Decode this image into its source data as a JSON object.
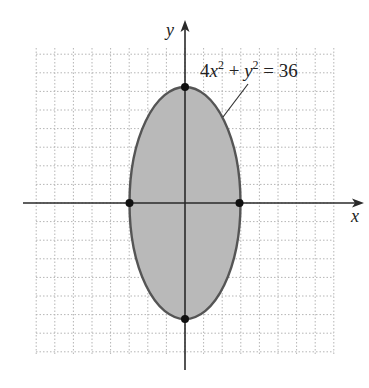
{
  "chart_data": {
    "type": "line",
    "title": "",
    "xlabel": "x",
    "ylabel": "y",
    "xlim": [
      -8.5,
      8.5
    ],
    "ylim": [
      -8.5,
      8.5
    ],
    "grid": true,
    "series": [
      {
        "name": "4x^2 + y^2 = 36",
        "kind": "ellipse",
        "center": [
          0,
          0
        ],
        "semi_axis_x": 3,
        "semi_axis_y": 6,
        "filled": true
      }
    ],
    "points": [
      {
        "x": 0,
        "y": 6
      },
      {
        "x": 0,
        "y": -6
      },
      {
        "x": -3,
        "y": 0
      },
      {
        "x": 3,
        "y": 0
      }
    ],
    "annotations": [
      {
        "text": "4x² + y² = 36",
        "points_to": "ellipse"
      }
    ]
  },
  "labels": {
    "x_axis": "x",
    "y_axis": "y",
    "eq_coef": "4",
    "eq_x": "x",
    "eq_sup1": "2",
    "eq_plus": " + ",
    "eq_y": "y",
    "eq_sup2": "2",
    "eq_rhs": " = 36"
  },
  "colors": {
    "fill": "#b9b9b9",
    "stroke": "#555555",
    "grid": "#b5b5b5"
  }
}
